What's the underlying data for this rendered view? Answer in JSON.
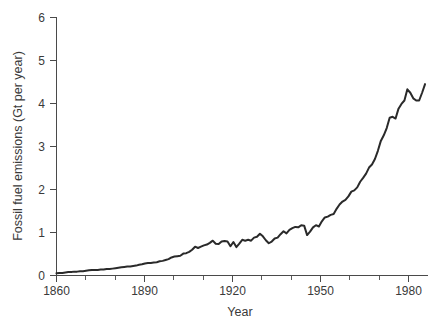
{
  "chart_data": {
    "type": "line",
    "title": "",
    "subtitle": "",
    "xlabel": "Year",
    "ylabel": "Fossil fuel emissions (Gt per year)",
    "xlim": [
      1860,
      1986
    ],
    "ylim": [
      0,
      6
    ],
    "xticks": [
      1860,
      1890,
      1920,
      1950,
      1980
    ],
    "xtick_labels": [
      "1860",
      "1890",
      "1920",
      "1950",
      "1980"
    ],
    "xminor_step": 10,
    "yticks": [
      0,
      1,
      2,
      3,
      4,
      5,
      6
    ],
    "ytick_labels": [
      "0",
      "1",
      "2",
      "3",
      "4",
      "5",
      "6"
    ],
    "grid": false,
    "legend": false,
    "legend_position": "none",
    "line_color": "#2a2a2a",
    "axis_color": "#4a4a4a",
    "background_color": "#ffffff",
    "units": "Gt per year",
    "series": [
      {
        "name": "Fossil fuel emissions",
        "x": [
          1860,
          1861,
          1862,
          1863,
          1864,
          1865,
          1866,
          1867,
          1868,
          1869,
          1870,
          1871,
          1872,
          1873,
          1874,
          1875,
          1876,
          1877,
          1878,
          1879,
          1880,
          1881,
          1882,
          1883,
          1884,
          1885,
          1886,
          1887,
          1888,
          1889,
          1890,
          1891,
          1892,
          1893,
          1894,
          1895,
          1896,
          1897,
          1898,
          1899,
          1900,
          1901,
          1902,
          1903,
          1904,
          1905,
          1906,
          1907,
          1908,
          1909,
          1910,
          1911,
          1912,
          1913,
          1914,
          1915,
          1916,
          1917,
          1918,
          1919,
          1920,
          1921,
          1922,
          1923,
          1924,
          1925,
          1926,
          1927,
          1928,
          1929,
          1930,
          1931,
          1932,
          1933,
          1934,
          1935,
          1936,
          1937,
          1938,
          1939,
          1940,
          1941,
          1942,
          1943,
          1944,
          1945,
          1946,
          1947,
          1948,
          1949,
          1950,
          1951,
          1952,
          1953,
          1954,
          1955,
          1956,
          1957,
          1958,
          1959,
          1960,
          1961,
          1962,
          1963,
          1964,
          1965,
          1966,
          1967,
          1968,
          1969,
          1970,
          1971,
          1972,
          1973,
          1974,
          1975,
          1976,
          1977,
          1978,
          1979,
          1980,
          1981,
          1982,
          1983,
          1984,
          1985
        ],
        "values": [
          0.05,
          0.06,
          0.06,
          0.07,
          0.08,
          0.08,
          0.09,
          0.09,
          0.1,
          0.1,
          0.11,
          0.12,
          0.13,
          0.13,
          0.13,
          0.14,
          0.14,
          0.15,
          0.15,
          0.16,
          0.17,
          0.18,
          0.19,
          0.2,
          0.21,
          0.21,
          0.22,
          0.23,
          0.25,
          0.26,
          0.28,
          0.29,
          0.29,
          0.3,
          0.31,
          0.33,
          0.34,
          0.36,
          0.38,
          0.42,
          0.44,
          0.45,
          0.46,
          0.51,
          0.52,
          0.55,
          0.6,
          0.67,
          0.64,
          0.67,
          0.7,
          0.72,
          0.76,
          0.81,
          0.74,
          0.73,
          0.79,
          0.8,
          0.79,
          0.68,
          0.78,
          0.66,
          0.74,
          0.83,
          0.81,
          0.83,
          0.81,
          0.88,
          0.9,
          0.97,
          0.91,
          0.82,
          0.75,
          0.79,
          0.86,
          0.88,
          0.96,
          1.03,
          0.98,
          1.06,
          1.1,
          1.13,
          1.12,
          1.17,
          1.16,
          0.94,
          1.02,
          1.12,
          1.17,
          1.14,
          1.26,
          1.35,
          1.37,
          1.41,
          1.43,
          1.55,
          1.65,
          1.72,
          1.76,
          1.84,
          1.95,
          1.98,
          2.05,
          2.18,
          2.27,
          2.37,
          2.51,
          2.58,
          2.71,
          2.9,
          3.13,
          3.26,
          3.43,
          3.67,
          3.69,
          3.65,
          3.88,
          3.99,
          4.07,
          4.33,
          4.25,
          4.12,
          4.07,
          4.07,
          4.25,
          4.45
        ]
      }
    ],
    "annotations": []
  },
  "axes": {
    "x_axis_title": "Year",
    "y_axis_title": "Fossil fuel emissions (Gt per year)"
  }
}
